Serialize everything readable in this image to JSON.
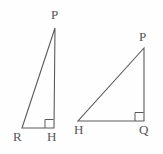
{
  "figure": {
    "type": "geometry-diagram",
    "background_color": "#fefefe",
    "stroke_color": "#5a5a5a",
    "label_color": "#555555",
    "stroke_width": 1.1,
    "width": 163,
    "height": 154,
    "triangles": [
      {
        "name": "triangle-prh",
        "vertices": [
          {
            "label": "P",
            "x": 55,
            "y": 28,
            "label_x": 51,
            "label_y": 8
          },
          {
            "label": "R",
            "x": 22,
            "y": 128,
            "label_x": 13,
            "label_y": 130
          },
          {
            "label": "H",
            "x": 54,
            "y": 128,
            "label_x": 47,
            "label_y": 130
          }
        ],
        "right_angle_at": "H",
        "right_angle_marker": {
          "x": 45,
          "y": 119,
          "size": 9
        },
        "path": "M 55 28 L 22 128 L 54 128 Z"
      },
      {
        "name": "triangle-phq",
        "vertices": [
          {
            "label": "P",
            "x": 144,
            "y": 48,
            "label_x": 139,
            "label_y": 30
          },
          {
            "label": "H",
            "x": 78,
            "y": 121,
            "label_x": 74,
            "label_y": 123
          },
          {
            "label": "Q",
            "x": 144,
            "y": 121,
            "label_x": 139,
            "label_y": 123
          }
        ],
        "right_angle_at": "Q",
        "right_angle_marker": {
          "x": 135,
          "y": 112,
          "size": 9
        },
        "path": "M 144 48 L 78 121 L 144 121 Z"
      }
    ]
  }
}
